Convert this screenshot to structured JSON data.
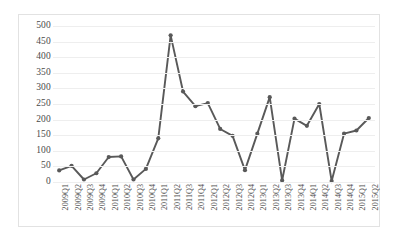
{
  "chart_data": {
    "type": "line",
    "title": "",
    "subtitle": "",
    "xlabel": "",
    "ylabel": "",
    "ylim": [
      0,
      500
    ],
    "ytick_labels": [
      "500",
      "450",
      "400",
      "350",
      "300",
      "250",
      "200",
      "150",
      "100",
      "50",
      "0"
    ],
    "ytick_values": [
      500,
      450,
      400,
      350,
      300,
      250,
      200,
      150,
      100,
      50,
      0
    ],
    "grid": true,
    "legend": "none",
    "series_color": "#595959",
    "marker": "circle",
    "categories": [
      "2009Q1",
      "2009Q2",
      "2009Q3",
      "2009Q4",
      "2010Q1",
      "2010Q2",
      "2010Q3",
      "2010Q4",
      "2011Q1",
      "2011Q2",
      "2011Q3",
      "2011Q4",
      "2012Q1",
      "2012Q2",
      "2012Q3",
      "2012Q4",
      "2013Q1",
      "2013Q2",
      "2013Q3",
      "2013Q4",
      "2014Q1",
      "2014Q2",
      "2014Q3",
      "2014Q4",
      "2015Q1",
      "2015Q2"
    ],
    "values": [
      37,
      52,
      8,
      28,
      80,
      82,
      8,
      42,
      140,
      470,
      290,
      243,
      253,
      170,
      148,
      38,
      155,
      272,
      5,
      203,
      180,
      250,
      3,
      155,
      165,
      205
    ]
  }
}
